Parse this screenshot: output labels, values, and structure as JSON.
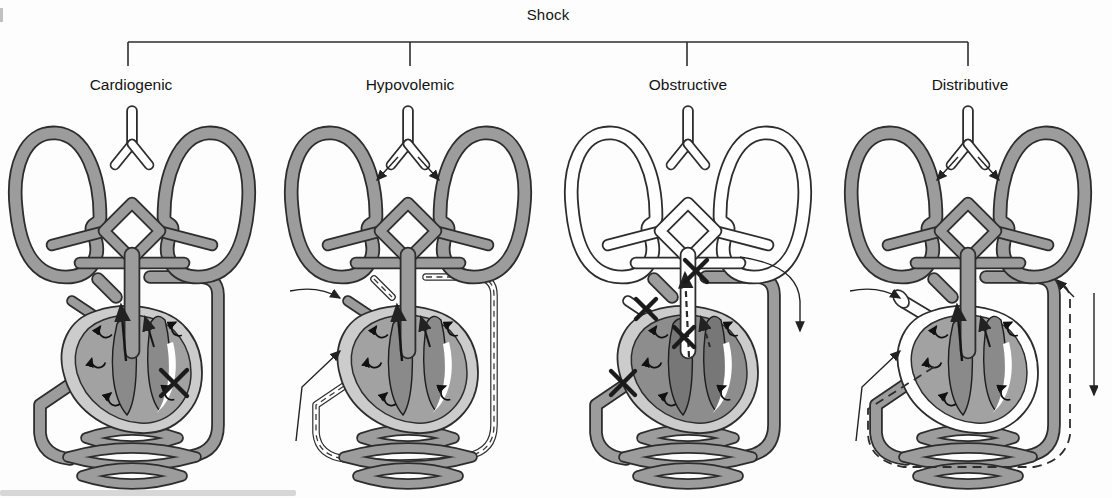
{
  "title": "Shock",
  "bracket": {
    "y": 42,
    "left_x": 128,
    "right_x": 968,
    "tick_xs": [
      128,
      410,
      687,
      968
    ],
    "tick_bottom_y": 66
  },
  "colors": {
    "outline": "#2d2d2d",
    "vessel_fill": "#9c9c9c",
    "empty_fill": "#ffffff",
    "heart_outer": "#cccccc",
    "heart_chamber": "#a2a2a2",
    "heart_chamber_congested": "#8d8d8d",
    "ventricle": "#8a8a8a",
    "ventricle_congested": "#777777",
    "arrow": "#222222",
    "text": "#141414",
    "background": "#fdfdfd"
  },
  "panels": [
    {
      "id": "cardiogenic",
      "label": "Cardiogenic",
      "label_x": 131,
      "diagram_left": 2,
      "features": {
        "lungs": "filled",
        "pulmonary_vessels": "filled",
        "systemic_loop": "filled",
        "heart_outer": "normal",
        "heart_chambers": "normal",
        "bronchial_arrows": false,
        "vena_cava": "stub",
        "aorta_arrow": "solid",
        "dashed_outside": false,
        "x_marks": [
          "left-ventricle"
        ],
        "flow_arrows": []
      }
    },
    {
      "id": "hypovolemic",
      "label": "Hypovolemic",
      "label_x": 410,
      "diagram_left": 278,
      "features": {
        "lungs": "filled",
        "pulmonary_vessels": "filled",
        "systemic_loop": "collapsed",
        "heart_outer": "normal",
        "heart_chambers": "normal",
        "bronchial_arrows": true,
        "vena_cava": "stub",
        "aorta_arrow": "solid",
        "dashed_outside": false,
        "x_marks": [],
        "flow_arrows": [
          "vena-cava-inflow",
          "venous-return"
        ]
      }
    },
    {
      "id": "obstructive",
      "label": "Obstructive",
      "label_x": 688,
      "diagram_left": 558,
      "features": {
        "lungs": "empty",
        "pulmonary_vessels": "empty",
        "systemic_loop": "filled",
        "heart_outer": "normal",
        "heart_chambers": "congested",
        "bronchial_arrows": false,
        "vena_cava": "stub-empty",
        "aorta_arrow": "dashed",
        "dashed_outside": false,
        "x_marks": [
          "pulmonary-artery",
          "superior-vena-cava",
          "aortic-valve",
          "inferior-vena-cava"
        ],
        "flow_arrows": [
          "shunt-right"
        ]
      }
    },
    {
      "id": "distributive",
      "label": "Distributive",
      "label_x": 970,
      "diagram_left": 838,
      "features": {
        "lungs": "filled",
        "pulmonary_vessels": "filled",
        "systemic_loop": "filled",
        "heart_outer": "dilated",
        "heart_chambers": "normal",
        "bronchial_arrows": true,
        "vena_cava": "dilated-open",
        "aorta_arrow": "solid",
        "dashed_outside": true,
        "x_marks": [],
        "flow_arrows": [
          "vena-cava-inflow",
          "venous-return",
          "arterial-runoff-right",
          "into-loop-top-right"
        ]
      }
    }
  ]
}
